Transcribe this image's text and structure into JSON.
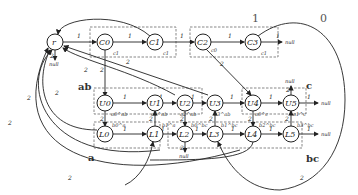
{
  "diagram": {
    "groups": [
      {
        "id": "g1",
        "label": "1"
      },
      {
        "id": "g0",
        "label": "0"
      },
      {
        "id": "ab",
        "label": "ab"
      },
      {
        "id": "c",
        "label": "c"
      },
      {
        "id": "a",
        "label": "a"
      },
      {
        "id": "bc",
        "label": "bc"
      }
    ],
    "nodes": [
      {
        "id": "r",
        "label": "r"
      },
      {
        "id": "C0",
        "label": "C0",
        "sub": "c1"
      },
      {
        "id": "C1",
        "label": "C1",
        "sub": "c1"
      },
      {
        "id": "C2",
        "label": "C2",
        "sub": "c0"
      },
      {
        "id": "C3",
        "label": "C3",
        "sub": "c1"
      },
      {
        "id": "U0",
        "label": "U0",
        "sub": "a0^ab"
      },
      {
        "id": "U1",
        "label": "U1",
        "sub": "a1^ab"
      },
      {
        "id": "U2",
        "label": "U2",
        "sub": "a2^ab"
      },
      {
        "id": "U3",
        "label": "U3",
        "sub": "a3^ab"
      },
      {
        "id": "U4",
        "label": "U4",
        "sub": "a0^c"
      },
      {
        "id": "U5",
        "label": "U5",
        "sub": "a1^c"
      },
      {
        "id": "L0",
        "label": "L0",
        "sub": "b0^a"
      },
      {
        "id": "L1",
        "label": "L1",
        "sub": "b1^a"
      },
      {
        "id": "L2",
        "label": "L2",
        "sub": "b0^bc"
      },
      {
        "id": "L3",
        "label": "L3",
        "sub": "b1^bc"
      },
      {
        "id": "L4",
        "label": "L4",
        "sub": "b2^bc"
      },
      {
        "id": "L5",
        "label": "L5",
        "sub": "b3^bc"
      }
    ],
    "edge_labels": {
      "one": "1",
      "two": "2"
    },
    "null_label": "null"
  }
}
